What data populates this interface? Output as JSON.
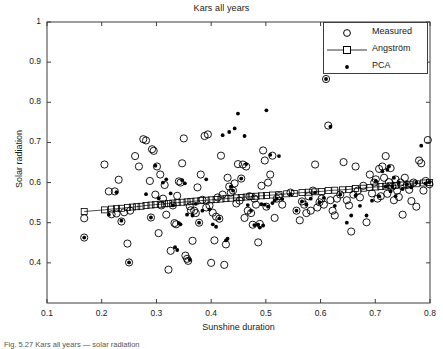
{
  "figure": {
    "width": 443,
    "height": 349,
    "background": "#ffffff",
    "axis_color": "#3c3c3c",
    "text_color": "#1a1a1a"
  },
  "caption": "Fig. 5.27  Kars all years — solar radiation",
  "legend": {
    "position": "top-right",
    "entries": [
      {
        "label": "Measured",
        "marker": "open-circle",
        "color": "#000000"
      },
      {
        "label": "Angström",
        "marker": "line-with-open-square",
        "color": "#000000"
      },
      {
        "label": "PCA",
        "marker": "filled-dot",
        "color": "#000000"
      }
    ]
  },
  "chart_data": {
    "type": "scatter",
    "title": "Kars all years",
    "xlabel": "Sunshine duration",
    "ylabel": "Solar radiation",
    "xlim": [
      0.1,
      0.8
    ],
    "ylim": [
      0.3,
      1.0
    ],
    "xticks": [
      0.1,
      0.2,
      0.3,
      0.4,
      0.5,
      0.6,
      0.7,
      0.8
    ],
    "xticklabels": [
      "0.1",
      "0.2",
      "0.3",
      "0.4",
      "0.5",
      "0.6",
      "0.7",
      "0.8"
    ],
    "yticks": [
      0.4,
      0.5,
      0.6,
      0.7,
      0.8,
      0.9,
      1.0
    ],
    "yticklabels": [
      "0.4",
      "0.5",
      "0.6",
      "0.7",
      "0.8",
      "0.9",
      "1"
    ],
    "grid": false,
    "series": [
      {
        "name": "Measured",
        "marker": "open-circle",
        "x": [
          0.168,
          0.168,
          0.205,
          0.213,
          0.218,
          0.224,
          0.227,
          0.231,
          0.236,
          0.241,
          0.247,
          0.25,
          0.252,
          0.261,
          0.268,
          0.276,
          0.281,
          0.288,
          0.29,
          0.292,
          0.295,
          0.298,
          0.301,
          0.304,
          0.307,
          0.309,
          0.312,
          0.315,
          0.318,
          0.322,
          0.326,
          0.33,
          0.333,
          0.336,
          0.338,
          0.341,
          0.344,
          0.347,
          0.35,
          0.353,
          0.356,
          0.358,
          0.361,
          0.363,
          0.366,
          0.369,
          0.372,
          0.375,
          0.378,
          0.381,
          0.384,
          0.388,
          0.391,
          0.394,
          0.397,
          0.4,
          0.403,
          0.406,
          0.409,
          0.412,
          0.415,
          0.418,
          0.421,
          0.424,
          0.427,
          0.43,
          0.433,
          0.436,
          0.44,
          0.443,
          0.446,
          0.449,
          0.452,
          0.455,
          0.458,
          0.461,
          0.464,
          0.467,
          0.47,
          0.473,
          0.476,
          0.479,
          0.482,
          0.486,
          0.489,
          0.492,
          0.495,
          0.498,
          0.501,
          0.504,
          0.508,
          0.512,
          0.516,
          0.52,
          0.524,
          0.53,
          0.545,
          0.556,
          0.562,
          0.566,
          0.57,
          0.574,
          0.578,
          0.582,
          0.586,
          0.59,
          0.594,
          0.598,
          0.602,
          0.606,
          0.61,
          0.614,
          0.618,
          0.622,
          0.626,
          0.63,
          0.636,
          0.642,
          0.648,
          0.652,
          0.656,
          0.66,
          0.664,
          0.668,
          0.672,
          0.678,
          0.684,
          0.69,
          0.694,
          0.698,
          0.701,
          0.704,
          0.707,
          0.71,
          0.713,
          0.716,
          0.719,
          0.722,
          0.725,
          0.728,
          0.731,
          0.734,
          0.737,
          0.74,
          0.743,
          0.746,
          0.75,
          0.754,
          0.758,
          0.762,
          0.766,
          0.77,
          0.775,
          0.78,
          0.784,
          0.788,
          0.792,
          0.796,
          0.799
        ],
        "y": [
          0.463,
          0.511,
          0.645,
          0.578,
          0.521,
          0.578,
          0.523,
          0.607,
          0.503,
          0.526,
          0.448,
          0.401,
          0.53,
          0.666,
          0.64,
          0.708,
          0.705,
          0.604,
          0.513,
          0.683,
          0.679,
          0.57,
          0.64,
          0.474,
          0.62,
          0.543,
          0.56,
          0.594,
          0.52,
          0.383,
          0.43,
          0.543,
          0.499,
          0.496,
          0.567,
          0.603,
          0.6,
          0.648,
          0.71,
          0.418,
          0.41,
          0.405,
          0.541,
          0.531,
          0.455,
          0.53,
          0.524,
          0.588,
          0.5,
          0.62,
          0.557,
          0.716,
          0.538,
          0.72,
          0.543,
          0.4,
          0.525,
          0.456,
          0.515,
          0.563,
          0.51,
          0.667,
          0.57,
          0.395,
          0.446,
          0.612,
          0.59,
          0.575,
          0.58,
          0.598,
          0.548,
          0.646,
          0.555,
          0.61,
          0.645,
          0.512,
          0.64,
          0.53,
          0.566,
          0.524,
          0.495,
          0.56,
          0.545,
          0.451,
          0.497,
          0.592,
          0.68,
          0.655,
          0.54,
          0.6,
          0.62,
          0.667,
          0.512,
          0.56,
          0.566,
          0.545,
          0.575,
          0.53,
          0.506,
          0.553,
          0.545,
          0.524,
          0.566,
          0.53,
          0.58,
          0.645,
          0.538,
          0.551,
          0.56,
          0.545,
          0.858,
          0.742,
          0.556,
          0.53,
          0.518,
          0.56,
          0.57,
          0.651,
          0.556,
          0.543,
          0.478,
          0.57,
          0.64,
          0.58,
          0.563,
          0.592,
          0.501,
          0.62,
          0.573,
          0.6,
          0.608,
          0.56,
          0.634,
          0.566,
          0.64,
          0.612,
          0.666,
          0.572,
          0.601,
          0.636,
          0.59,
          0.556,
          0.608,
          0.58,
          0.564,
          0.6,
          0.52,
          0.612,
          0.594,
          0.582,
          0.554,
          0.6,
          0.54,
          0.655,
          0.648,
          0.58,
          0.604,
          0.706,
          0.596
        ]
      },
      {
        "name": "PCA",
        "marker": "filled-dot",
        "x": [
          0.168,
          0.213,
          0.227,
          0.236,
          0.25,
          0.281,
          0.29,
          0.298,
          0.304,
          0.312,
          0.318,
          0.326,
          0.33,
          0.334,
          0.338,
          0.341,
          0.344,
          0.347,
          0.352,
          0.356,
          0.361,
          0.366,
          0.372,
          0.378,
          0.384,
          0.391,
          0.397,
          0.403,
          0.409,
          0.415,
          0.421,
          0.427,
          0.43,
          0.433,
          0.436,
          0.44,
          0.443,
          0.449,
          0.455,
          0.461,
          0.464,
          0.467,
          0.473,
          0.479,
          0.486,
          0.489,
          0.492,
          0.495,
          0.498,
          0.501,
          0.504,
          0.508,
          0.512,
          0.516,
          0.52,
          0.524,
          0.53,
          0.545,
          0.556,
          0.566,
          0.574,
          0.582,
          0.59,
          0.598,
          0.606,
          0.61,
          0.618,
          0.626,
          0.636,
          0.648,
          0.656,
          0.664,
          0.672,
          0.684,
          0.694,
          0.701,
          0.707,
          0.713,
          0.719,
          0.722,
          0.725,
          0.728,
          0.731,
          0.734,
          0.737,
          0.743,
          0.75,
          0.758,
          0.766,
          0.775,
          0.784,
          0.792,
          0.799
        ],
        "y": [
          0.463,
          0.52,
          0.576,
          0.505,
          0.401,
          0.571,
          0.513,
          0.642,
          0.561,
          0.6,
          0.608,
          0.573,
          0.543,
          0.439,
          0.432,
          0.499,
          0.496,
          0.606,
          0.598,
          0.52,
          0.408,
          0.518,
          0.547,
          0.5,
          0.53,
          0.608,
          0.533,
          0.496,
          0.49,
          0.511,
          0.718,
          0.456,
          0.46,
          0.726,
          0.59,
          0.58,
          0.735,
          0.772,
          0.61,
          0.716,
          0.646,
          0.544,
          0.53,
          0.494,
          0.495,
          0.488,
          0.546,
          0.493,
          0.545,
          0.78,
          0.54,
          0.669,
          0.549,
          0.555,
          0.56,
          0.666,
          0.559,
          0.571,
          0.53,
          0.553,
          0.545,
          0.56,
          0.575,
          0.551,
          0.562,
          0.858,
          0.739,
          0.542,
          0.57,
          0.5,
          0.518,
          0.568,
          0.542,
          0.518,
          0.555,
          0.604,
          0.566,
          0.628,
          0.59,
          0.632,
          0.64,
          0.578,
          0.59,
          0.612,
          0.566,
          0.6,
          0.584,
          0.596,
          0.588,
          0.6,
          0.692,
          0.598,
          0.601
        ]
      },
      {
        "name": "Angström",
        "marker": "line-with-open-square",
        "x": [
          0.168,
          0.205,
          0.218,
          0.227,
          0.236,
          0.247,
          0.256,
          0.264,
          0.272,
          0.281,
          0.29,
          0.298,
          0.307,
          0.315,
          0.322,
          0.33,
          0.338,
          0.347,
          0.356,
          0.363,
          0.372,
          0.381,
          0.391,
          0.4,
          0.409,
          0.418,
          0.427,
          0.436,
          0.446,
          0.455,
          0.464,
          0.473,
          0.482,
          0.492,
          0.501,
          0.512,
          0.524,
          0.538,
          0.552,
          0.566,
          0.578,
          0.59,
          0.602,
          0.614,
          0.626,
          0.64,
          0.652,
          0.664,
          0.678,
          0.69,
          0.701,
          0.71,
          0.719,
          0.728,
          0.737,
          0.75,
          0.762,
          0.775,
          0.788,
          0.799
        ],
        "y": [
          0.528,
          0.532,
          0.534,
          0.535,
          0.536,
          0.538,
          0.539,
          0.54,
          0.541,
          0.543,
          0.544,
          0.545,
          0.546,
          0.547,
          0.548,
          0.549,
          0.55,
          0.551,
          0.552,
          0.553,
          0.554,
          0.555,
          0.556,
          0.557,
          0.558,
          0.559,
          0.56,
          0.561,
          0.562,
          0.563,
          0.564,
          0.565,
          0.566,
          0.567,
          0.568,
          0.569,
          0.57,
          0.572,
          0.573,
          0.575,
          0.576,
          0.577,
          0.578,
          0.58,
          0.581,
          0.582,
          0.583,
          0.585,
          0.586,
          0.588,
          0.589,
          0.59,
          0.591,
          0.592,
          0.593,
          0.594,
          0.596,
          0.597,
          0.599,
          0.6
        ]
      }
    ]
  }
}
